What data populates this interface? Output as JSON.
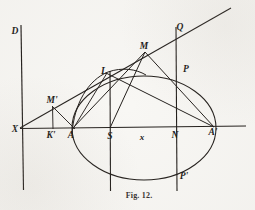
{
  "figure": {
    "caption": "Fig. 12.",
    "caption_x": 139,
    "caption_y": 195,
    "ink_color": "#231f1c",
    "paper_color": "#f8f7f4",
    "width": 255,
    "height": 210
  },
  "labels": [
    {
      "text": "D",
      "x": 15,
      "y": 32,
      "name": "point-label-d"
    },
    {
      "text": "X",
      "x": 15,
      "y": 130,
      "name": "point-label-x-capital"
    },
    {
      "text": "M'",
      "x": 52,
      "y": 101,
      "name": "point-label-m-prime"
    },
    {
      "text": "K'",
      "x": 51,
      "y": 136,
      "name": "point-label-k-prime"
    },
    {
      "text": "A",
      "x": 71,
      "y": 136,
      "name": "point-label-a"
    },
    {
      "text": "L",
      "x": 104,
      "y": 72,
      "name": "point-label-l"
    },
    {
      "text": "S",
      "x": 110,
      "y": 137,
      "name": "point-label-s"
    },
    {
      "text": "M",
      "x": 144,
      "y": 47,
      "name": "point-label-m"
    },
    {
      "text": "x",
      "x": 142,
      "y": 137,
      "name": "point-label-x-small"
    },
    {
      "text": "N",
      "x": 175,
      "y": 136,
      "name": "point-label-n"
    },
    {
      "text": "Q",
      "x": 180,
      "y": 28,
      "name": "point-label-q"
    },
    {
      "text": "P",
      "x": 186,
      "y": 70,
      "name": "point-label-p"
    },
    {
      "text": "P'",
      "x": 184,
      "y": 177,
      "name": "point-label-p-prime"
    },
    {
      "text": "A'",
      "x": 213,
      "y": 133,
      "name": "point-label-a-prime"
    }
  ],
  "geometry": {
    "ellipse": {
      "cx": 144,
      "cy": 128,
      "rx": 72,
      "ry": 52
    },
    "axis_line": {
      "x1": 20,
      "y1": 128,
      "x2": 246,
      "y2": 126
    },
    "directrix": {
      "x1": 21,
      "y1": 25,
      "x2": 23,
      "y2": 190
    },
    "tangent_line": {
      "x1": 20,
      "y1": 128,
      "x2": 231,
      "y2": 8
    },
    "ordinate_s": {
      "x": 110,
      "y1": 72,
      "y2": 190
    },
    "ordinate_n": {
      "x": 176,
      "y1": 28,
      "y2": 190
    },
    "ordinate_kprime": {
      "x": 52,
      "y1": 106,
      "y2": 128
    },
    "chord_l_aprime": {
      "x1": 107,
      "y1": 73,
      "x2": 214,
      "y2": 127
    },
    "chord_a_m": {
      "x1": 73,
      "y1": 128,
      "x2": 145,
      "y2": 52
    },
    "chord_s_m": {
      "x1": 110,
      "y1": 128,
      "x2": 145,
      "y2": 52
    },
    "chord_m_aprime": {
      "x1": 145,
      "y1": 52,
      "x2": 214,
      "y2": 127
    },
    "chord_l_s": {
      "x1": 107,
      "y1": 73,
      "x2": 110,
      "y2": 128
    },
    "chord_mprime_a": {
      "x1": 52,
      "y1": 106,
      "x2": 74,
      "y2": 128
    },
    "arc_a_l": {
      "desc": "curve through A rising to L"
    }
  }
}
